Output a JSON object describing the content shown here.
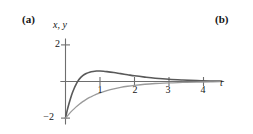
{
  "figure": {
    "panels": [
      {
        "key": "a",
        "label": "(a)"
      },
      {
        "key": "b",
        "label": "(b)"
      }
    ]
  },
  "chart_data": {
    "type": "line",
    "title": "",
    "xlabel": "t",
    "ylabel": "x, y",
    "xlim": [
      -0.15,
      4.6
    ],
    "ylim": [
      -2.35,
      2.35
    ],
    "grid": false,
    "legend": "none",
    "axis_captions": {
      "vertical": "x, y",
      "horizontal": "t"
    },
    "xticks": [
      1,
      2,
      3,
      4
    ],
    "xtick_labels": [
      "1",
      "2",
      "3",
      "4"
    ],
    "yticks": [
      2,
      -2
    ],
    "ytick_labels": [
      "2",
      "−2"
    ],
    "series": [
      {
        "name": "x",
        "color": "#595959",
        "width": 1.6,
        "points": [
          [
            0.0,
            -2.0
          ],
          [
            0.05,
            -1.58
          ],
          [
            0.1,
            -1.22
          ],
          [
            0.15,
            -0.9
          ],
          [
            0.2,
            -0.62
          ],
          [
            0.25,
            -0.38
          ],
          [
            0.3,
            -0.18
          ],
          [
            0.35,
            -0.01
          ],
          [
            0.4,
            0.13
          ],
          [
            0.5,
            0.32
          ],
          [
            0.6,
            0.44
          ],
          [
            0.7,
            0.51
          ],
          [
            0.8,
            0.55
          ],
          [
            0.9,
            0.57
          ],
          [
            1.0,
            0.57
          ],
          [
            1.1,
            0.56
          ],
          [
            1.2,
            0.54
          ],
          [
            1.4,
            0.49
          ],
          [
            1.6,
            0.43
          ],
          [
            1.8,
            0.37
          ],
          [
            2.0,
            0.31
          ],
          [
            2.3,
            0.24
          ],
          [
            2.6,
            0.18
          ],
          [
            3.0,
            0.12
          ],
          [
            3.4,
            0.08
          ],
          [
            3.8,
            0.05
          ],
          [
            4.2,
            0.03
          ],
          [
            4.5,
            0.02
          ]
        ]
      },
      {
        "name": "y",
        "color": "#9a9a9a",
        "width": 1.3,
        "points": [
          [
            0.0,
            -2.0
          ],
          [
            0.1,
            -1.78
          ],
          [
            0.2,
            -1.58
          ],
          [
            0.3,
            -1.4
          ],
          [
            0.4,
            -1.24
          ],
          [
            0.5,
            -1.1
          ],
          [
            0.6,
            -0.98
          ],
          [
            0.7,
            -0.87
          ],
          [
            0.8,
            -0.78
          ],
          [
            0.9,
            -0.69
          ],
          [
            1.0,
            -0.62
          ],
          [
            1.2,
            -0.5
          ],
          [
            1.4,
            -0.4
          ],
          [
            1.6,
            -0.32
          ],
          [
            1.8,
            -0.26
          ],
          [
            2.0,
            -0.21
          ],
          [
            2.3,
            -0.15
          ],
          [
            2.6,
            -0.11
          ],
          [
            3.0,
            -0.07
          ],
          [
            3.4,
            -0.05
          ],
          [
            3.8,
            -0.03
          ],
          [
            4.2,
            -0.02
          ],
          [
            4.5,
            -0.01
          ]
        ]
      }
    ]
  }
}
